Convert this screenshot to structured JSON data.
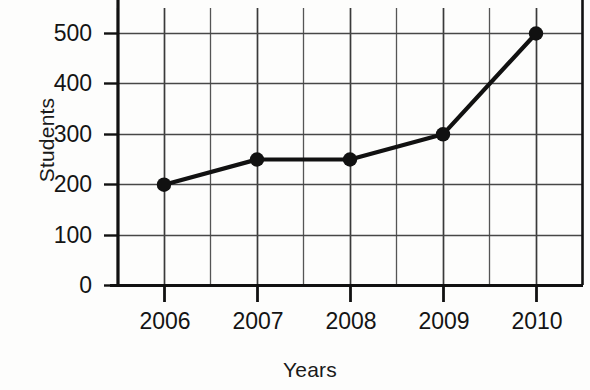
{
  "chart_data": {
    "type": "line",
    "title": "",
    "xlabel": "Years",
    "ylabel": "Students",
    "categories": [
      "2006",
      "2007",
      "2008",
      "2009",
      "2010"
    ],
    "values": [
      200,
      250,
      250,
      300,
      500
    ],
    "series": [
      {
        "name": "Students",
        "values": [
          200,
          250,
          250,
          300,
          500
        ]
      }
    ],
    "x": [
      2006,
      2007,
      2008,
      2009,
      2010
    ],
    "xlim": [
      2005.5,
      2010.5
    ],
    "ylim": [
      0,
      540
    ],
    "y_ticks": [
      "0",
      "100",
      "200",
      "300",
      "400",
      "500"
    ],
    "y_tick_values": [
      0,
      100,
      200,
      300,
      400,
      500
    ],
    "x_ticks": [
      "2006",
      "2007",
      "2008",
      "2009",
      "2010"
    ],
    "grid": true,
    "grid_minor_vertical": true,
    "legend": "none",
    "marker": "filled-circle",
    "line_color": "#111111",
    "grid_color": "#555555",
    "axis_color": "#111111",
    "background_color": "#fdfdfc"
  },
  "axes": {
    "y_title": "Students",
    "x_title": "Years"
  },
  "y_tick_labels": [
    "500",
    "400",
    "300",
    "200",
    "100",
    "0"
  ],
  "x_tick_labels": [
    "2006",
    "2007",
    "2008",
    "2009",
    "2010"
  ]
}
